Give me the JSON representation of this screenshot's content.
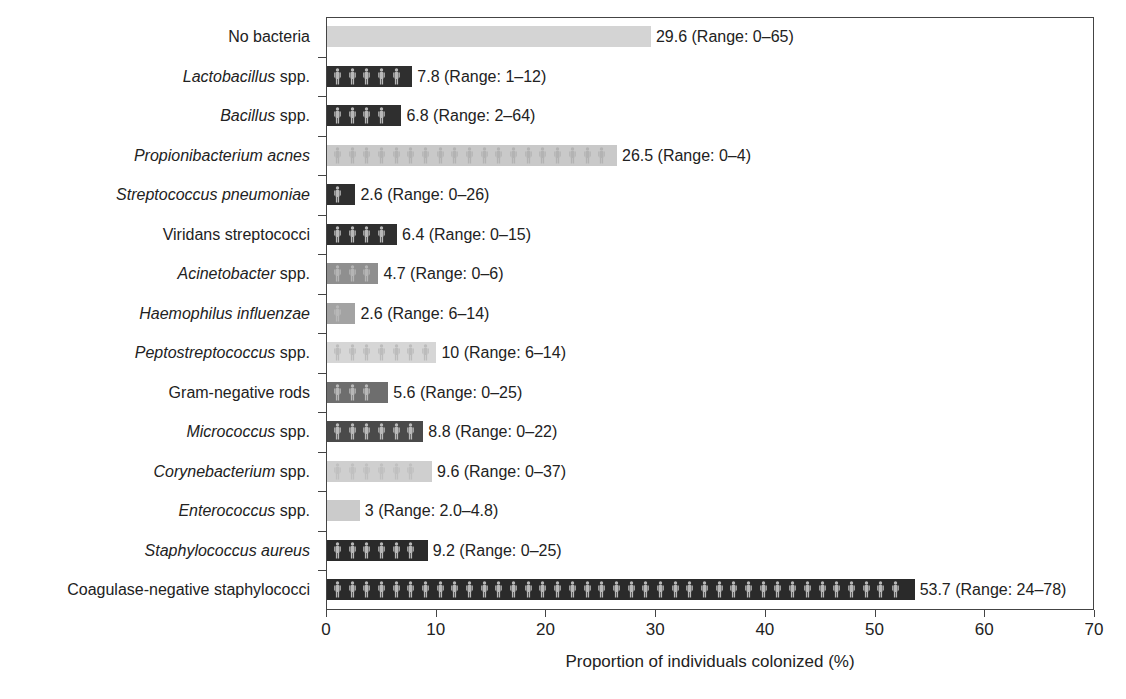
{
  "chart_data": {
    "type": "bar",
    "orientation": "horizontal",
    "title": "",
    "xlabel": "Proportion of individuals colonized (%)",
    "ylabel": "",
    "xlim": [
      0,
      70
    ],
    "xticks": [
      0,
      10,
      20,
      30,
      40,
      50,
      60,
      70
    ],
    "grid": false,
    "legend": null,
    "categories": [
      "No bacteria",
      "Lactobacillus spp.",
      "Bacillus spp.",
      "Propionibacterium acnes",
      "Streptococcus pneumoniae",
      "Viridans streptococci",
      "Acinetobacter spp.",
      "Haemophilus influenzae",
      "Peptostreptococcus spp.",
      "Gram-negative rods",
      "Micrococcus spp.",
      "Corynebacterium spp.",
      "Enterococcus spp.",
      "Staphylococcus aureus",
      "Coagulase-negative staphylococci"
    ],
    "values": [
      29.6,
      7.8,
      6.8,
      26.5,
      2.6,
      6.4,
      4.7,
      2.6,
      10,
      5.6,
      8.8,
      9.6,
      3,
      9.2,
      53.7
    ],
    "ranges": [
      "0–65",
      "1–12",
      "2–64",
      "0–4",
      "0–26",
      "0–15",
      "0–6",
      "6–14",
      "6–14",
      "0–25",
      "0–22",
      "0–37",
      "2.0–4.8",
      "0–25",
      "24–78"
    ],
    "annotations": [
      "29.6 (Range: 0–65)",
      "7.8 (Range: 1–12)",
      "6.8 (Range: 2–64)",
      "26.5 (Range: 0–4)",
      "2.6 (Range: 0–26)",
      "6.4 (Range: 0–15)",
      "4.7 (Range: 0–6)",
      "2.6 (Range: 6–14)",
      "10 (Range: 6–14)",
      "5.6 (Range: 0–25)",
      "8.8 (Range: 0–22)",
      "9.6 (Range: 0–37)",
      "3 (Range: 2.0–4.8)",
      "9.2 (Range: 0–25)",
      "53.7 (Range: 24–78)"
    ]
  },
  "rows": [
    {
      "italic": "",
      "plain": "No bacteria",
      "value": 29.6,
      "label": "29.6 (Range: 0–65)",
      "color": "#d4d4d4",
      "fig": "none"
    },
    {
      "italic": "Lactobacillus",
      "plain": " spp.",
      "value": 7.8,
      "label": "7.8 (Range: 1–12)",
      "color": "#2f2f2f",
      "fig": "#b8b8b8"
    },
    {
      "italic": "Bacillus",
      "plain": " spp.",
      "value": 6.8,
      "label": "6.8 (Range: 2–64)",
      "color": "#2f2f2f",
      "fig": "#b8b8b8"
    },
    {
      "italic": "Propionibacterium acnes",
      "plain": "",
      "value": 26.5,
      "label": "26.5 (Range: 0–4)",
      "color": "#c9c9c9",
      "fig": "#b3b3b3"
    },
    {
      "italic": "Streptococcus pneumoniae",
      "plain": "",
      "value": 2.6,
      "label": "2.6 (Range: 0–26)",
      "color": "#2f2f2f",
      "fig": "#b8b8b8"
    },
    {
      "italic": "",
      "plain": "Viridans streptococci",
      "value": 6.4,
      "label": "6.4 (Range: 0–15)",
      "color": "#2f2f2f",
      "fig": "#b8b8b8"
    },
    {
      "italic": "Acinetobacter",
      "plain": " spp.",
      "value": 4.7,
      "label": "4.7 (Range: 0–6)",
      "color": "#8f8f8f",
      "fig": "#b5b5b5"
    },
    {
      "italic": "Haemophilus influenzae",
      "plain": "",
      "value": 2.6,
      "label": "2.6 (Range: 6–14)",
      "color": "#a3a3a3",
      "fig": "#b8b8b8"
    },
    {
      "italic": "Peptostreptococcus",
      "plain": " spp.",
      "value": 10,
      "label": "10 (Range: 6–14)",
      "color": "#d6d6d6",
      "fig": "#bcbcbc"
    },
    {
      "italic": "",
      "plain": "Gram-negative rods",
      "value": 5.6,
      "label": "5.6 (Range: 0–25)",
      "color": "#6e6e6e",
      "fig": "#b8b8b8"
    },
    {
      "italic": "Micrococcus",
      "plain": " spp.",
      "value": 8.8,
      "label": "8.8 (Range: 0–22)",
      "color": "#4a4a4a",
      "fig": "#bababa"
    },
    {
      "italic": "Corynebacterium",
      "plain": " spp.",
      "value": 9.6,
      "label": "9.6 (Range: 0–37)",
      "color": "#cfcfcf",
      "fig": "#c0c0c0"
    },
    {
      "italic": "Enterococcus",
      "plain": " spp.",
      "value": 3,
      "label": "3 (Range: 2.0–4.8)",
      "color": "#cbcbcb",
      "fig": "none"
    },
    {
      "italic": "Staphylococcus aureus",
      "plain": "",
      "value": 9.2,
      "label": "9.2 (Range: 0–25)",
      "color": "#2a2a2a",
      "fig": "#b8b8b8"
    },
    {
      "italic": "",
      "plain": "Coagulase-negative staphylococci",
      "value": 53.7,
      "label": "53.7 (Range: 24–78)",
      "color": "#2a2a2a",
      "fig": "#b8b8b8"
    }
  ],
  "axis": {
    "xlabel": "Proportion of individuals colonized (%)",
    "ticks": [
      "0",
      "10",
      "20",
      "30",
      "40",
      "50",
      "60",
      "70"
    ]
  }
}
